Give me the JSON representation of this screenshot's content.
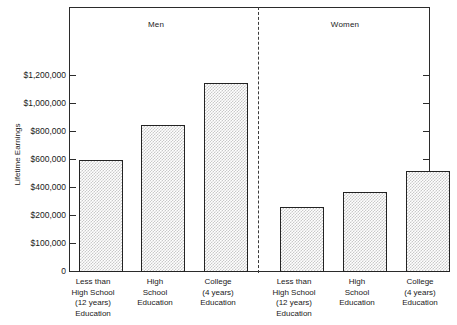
{
  "chart_data": {
    "type": "bar",
    "title": "",
    "xlabel": "",
    "ylabel": "Lifetime Earnings",
    "ylim": [
      0,
      1300000
    ],
    "grid": false,
    "legend_position": "none",
    "y_tick_labels": [
      "0",
      "$100,000",
      "$200,000",
      "$400,000",
      "$600,000",
      "$800,000",
      "$1,000,000",
      "$1,200,000"
    ],
    "y_tick_values": [
      0,
      100000,
      200000,
      400000,
      600000,
      800000,
      1000000,
      1200000
    ],
    "y_axis_note": "irregular (non-linear) tick spacing: equal pixel steps between listed ticks",
    "groups": [
      {
        "name": "Men",
        "categories": [
          "Less than High School (12 years) Education",
          "High School Education",
          "College (4 years) Education"
        ],
        "values": [
          600000,
          850000,
          1150000
        ]
      },
      {
        "name": "Women",
        "categories": [
          "Less than High School (12 years) Education",
          "High School Education",
          "College (4 years) Education"
        ],
        "values": [
          265000,
          375000,
          525000
        ]
      }
    ],
    "bars": [
      {
        "group": "Men",
        "label_lines": [
          "Less than",
          "High School",
          "(12 years)",
          "Education"
        ],
        "value": 600000
      },
      {
        "group": "Men",
        "label_lines": [
          "High",
          "School",
          "Education"
        ],
        "value": 850000
      },
      {
        "group": "Men",
        "label_lines": [
          "College",
          "(4 years)",
          "Education"
        ],
        "value": 1150000
      },
      {
        "group": "Women",
        "label_lines": [
          "Less than",
          "High School",
          "(12 years)",
          "Education"
        ],
        "value": 265000
      },
      {
        "group": "Women",
        "label_lines": [
          "High",
          "School",
          "Education"
        ],
        "value": 375000
      },
      {
        "group": "Women",
        "label_lines": [
          "College",
          "(4 years)",
          "Education"
        ],
        "value": 525000
      }
    ],
    "colors": {
      "bar_fill": "#c9c9c9",
      "bar_border": "#232323",
      "axis": "#2b2b2b",
      "text": "#1a1a1a",
      "divider": "#3a3a3a",
      "background": "#ffffff"
    }
  },
  "axis": {
    "y_title": "Lifetime Earnings",
    "ticks": [
      {
        "label": "$1,200,000"
      },
      {
        "label": "$1,000,000"
      },
      {
        "label": "$800,000"
      },
      {
        "label": "$600,000"
      },
      {
        "label": "$400,000"
      },
      {
        "label": "$200,000"
      },
      {
        "label": "$100,000"
      },
      {
        "label": "0"
      }
    ]
  },
  "groups": {
    "men": "Men",
    "women": "Women"
  },
  "categories": [
    {
      "l1": "Less than",
      "l2": "High School",
      "l3": "(12 years)",
      "l4": "Education"
    },
    {
      "l1": "High",
      "l2": "School",
      "l3": "Education",
      "l4": ""
    },
    {
      "l1": "College",
      "l2": "(4 years)",
      "l3": "Education",
      "l4": ""
    },
    {
      "l1": "Less than",
      "l2": "High School",
      "l3": "(12 years)",
      "l4": "Education"
    },
    {
      "l1": "High",
      "l2": "School",
      "l3": "Education",
      "l4": ""
    },
    {
      "l1": "College",
      "l2": "(4 years)",
      "l3": "Education",
      "l4": ""
    }
  ]
}
